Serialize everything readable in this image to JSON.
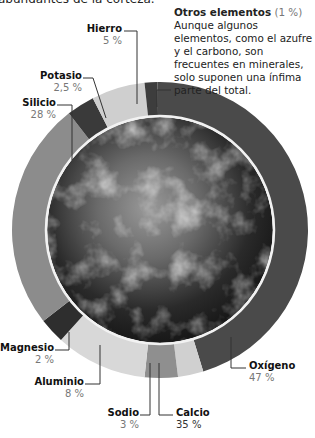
{
  "header": {
    "cut_text": "abundantes de la corteza."
  },
  "note": {
    "title": "Otros elementos",
    "pct": "(1 %)",
    "text": "Aunque algunos elementos, como el azufre y el carbono, son frecuentes en minerales, solo suponen una ínfima parte del total."
  },
  "labels": {
    "hierro": {
      "name": "Hierro",
      "pct": "5 %"
    },
    "potasio": {
      "name": "Potasio",
      "pct": "2,5 %"
    },
    "silicio": {
      "name": "Silicio",
      "pct": "28 %"
    },
    "magnesio": {
      "name": "Magnesio",
      "pct": "2 %"
    },
    "aluminio": {
      "name": "Aluminio",
      "pct": "8 %"
    },
    "sodio": {
      "name": "Sodio",
      "pct": "3 %"
    },
    "calcio": {
      "name": "Calcio",
      "pct": "35 %"
    },
    "oxigeno": {
      "name": "Oxígeno",
      "pct": "47 %"
    }
  },
  "chart_data": {
    "type": "pie",
    "style": "donut ring around Earth photo",
    "title": "",
    "categories": [
      "Oxígeno",
      "Calcio",
      "Sodio",
      "Aluminio",
      "Magnesio",
      "Silicio",
      "Potasio",
      "Hierro",
      "Otros elementos"
    ],
    "values": [
      47,
      35,
      3,
      8,
      2,
      28,
      2.5,
      5,
      1
    ],
    "value_labels": [
      "47 %",
      "35 %",
      "3 %",
      "8 %",
      "2 %",
      "28 %",
      "2,5 %",
      "5 %",
      "(1 %)"
    ],
    "colors": [
      "#4a4a4a",
      "#d0d0d0",
      "#8f8f8f",
      "#d8d8d8",
      "#2e2e2e",
      "#8c8c8c",
      "#3a3a3a",
      "#cfcfcf",
      "#3d3d3d"
    ],
    "legend": "callout labels with leader lines",
    "annotation": "Otros elementos (1 %) Aunque algunos elementos, como el azufre y el carbono, son frecuentes en minerales, solo suponen una ínfima parte del total."
  }
}
